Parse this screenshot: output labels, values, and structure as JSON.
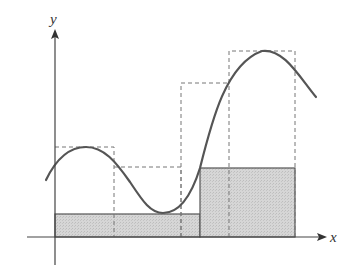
{
  "figure": {
    "axes": {
      "x_label": "x",
      "y_label": "y"
    },
    "colors": {
      "curve": "#555555",
      "axis": "#444444",
      "shaded_fill": "#d2d2d2",
      "shaded_stroke": "#555555",
      "dashed_stroke": "#777777"
    },
    "lower_rectangles": [
      {
        "name": "lower-rect-1",
        "x0": 55,
        "x1": 200,
        "top": 214
      },
      {
        "name": "lower-rect-2",
        "x0": 200,
        "x1": 295,
        "top": 168
      }
    ],
    "upper_rectangles": [
      {
        "name": "upper-rect-1",
        "x0": 55,
        "x1": 114,
        "top": 147
      },
      {
        "name": "upper-rect-2",
        "x0": 114,
        "x1": 181,
        "top": 167
      },
      {
        "name": "upper-rect-3",
        "x0": 181,
        "x1": 229,
        "top": 83
      },
      {
        "name": "upper-rect-4",
        "x0": 229,
        "x1": 295,
        "top": 51
      }
    ]
  }
}
